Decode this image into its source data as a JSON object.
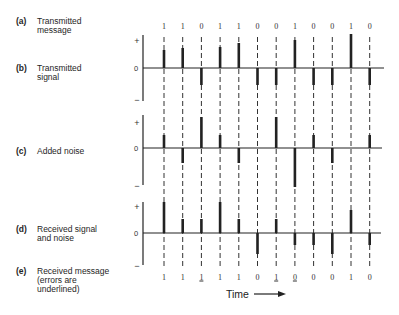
{
  "labels": [
    {
      "letter": "(a)",
      "lines": [
        "Transmitted",
        "message"
      ]
    },
    {
      "letter": "(b)",
      "lines": [
        "Transmitted",
        "signal"
      ]
    },
    {
      "letter": "(c)",
      "lines": [
        "Added noise"
      ]
    },
    {
      "letter": "(d)",
      "lines": [
        "Received signal",
        "and noise"
      ]
    },
    {
      "letter": "(e)",
      "lines": [
        "Received message",
        "(errors are",
        "underlined)"
      ]
    }
  ],
  "transmitted_message": [
    "1",
    "1",
    "0",
    "1",
    "1",
    "0",
    "0",
    "1",
    "0",
    "0",
    "1",
    "0"
  ],
  "received_message": [
    {
      "digit": "1",
      "error": false
    },
    {
      "digit": "1",
      "error": false
    },
    {
      "digit": "1",
      "error": true
    },
    {
      "digit": "1",
      "error": false
    },
    {
      "digit": "1",
      "error": false
    },
    {
      "digit": "0",
      "error": false
    },
    {
      "digit": "1",
      "error": true
    },
    {
      "digit": "0",
      "error": true
    },
    {
      "digit": "0",
      "error": false
    },
    {
      "digit": "0",
      "error": false
    },
    {
      "digit": "1",
      "error": false
    },
    {
      "digit": "0",
      "error": false
    }
  ],
  "panels": {
    "b": {
      "name": "Transmitted signal",
      "axis": {
        "plus": "+",
        "zero": "0",
        "minus": "−"
      },
      "amplitudes": [
        18,
        20,
        -17,
        21,
        25,
        -17,
        -17,
        28,
        -17,
        -17,
        34,
        -17
      ]
    },
    "c": {
      "name": "Added noise",
      "axis": {
        "plus": "+",
        "zero": "0",
        "minus": "−"
      },
      "amplitudes": [
        13,
        -15,
        31,
        13,
        -15,
        0,
        31,
        -39,
        13,
        -15,
        0,
        13
      ]
    },
    "d": {
      "name": "Received signal and noise",
      "axis": {
        "plus": "+",
        "zero": "0",
        "minus": "−"
      },
      "amplitudes": [
        31,
        14,
        14,
        31,
        14,
        -21,
        14,
        -12,
        -12,
        -21,
        23,
        -12
      ]
    }
  },
  "time": {
    "label": "Time"
  },
  "colors": {
    "ink": "#222222",
    "background": "#ffffff"
  },
  "chart_data": {
    "type": "bar",
    "title": "",
    "xlabel": "Time",
    "ylabel": "",
    "categories": [
      "1",
      "2",
      "3",
      "4",
      "5",
      "6",
      "7",
      "8",
      "9",
      "10",
      "11",
      "12"
    ],
    "series": [
      {
        "name": "Transmitted signal",
        "values": [
          18,
          20,
          -17,
          21,
          25,
          -17,
          -17,
          28,
          -17,
          -17,
          34,
          -17
        ]
      },
      {
        "name": "Added noise",
        "values": [
          13,
          -15,
          31,
          13,
          -15,
          0,
          31,
          -39,
          13,
          -15,
          0,
          13
        ]
      },
      {
        "name": "Received signal and noise",
        "values": [
          31,
          14,
          14,
          31,
          14,
          -21,
          14,
          -12,
          -12,
          -21,
          23,
          -12
        ]
      }
    ],
    "annotations": {
      "transmitted_message": "110110010010",
      "received_message": "111110100010",
      "error_positions": [
        3,
        7,
        8
      ]
    },
    "axis_ticks": [
      "+",
      "0",
      "−"
    ]
  }
}
